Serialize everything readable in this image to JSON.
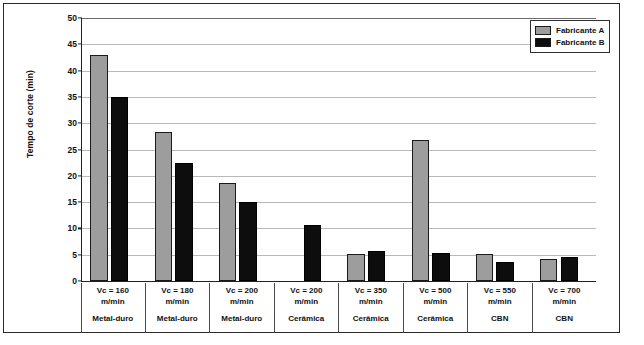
{
  "chart_data": {
    "type": "bar",
    "title": "",
    "xlabel": "",
    "ylabel": "Tempo de corte (min)",
    "ylim": [
      0,
      50
    ],
    "yticks": [
      0,
      5,
      10,
      15,
      20,
      25,
      30,
      35,
      40,
      45,
      50
    ],
    "grid": true,
    "legend_position": "top-right",
    "categories": [
      "Vc = 160 m/min",
      "Vc = 180 m/min",
      "Vc = 200 m/min",
      "Vc = 200 m/min",
      "Vc = 350 m/min",
      "Vc = 500 m/min",
      "Vc = 550 m/min",
      "Vc = 700 m/min"
    ],
    "category_lines": [
      {
        "vc": "Vc = 160\nm/min",
        "vc_line1": "Vc = 160",
        "vc_line2": "m/min",
        "material": "Metal-duro"
      },
      {
        "vc": "Vc = 180\nm/min",
        "vc_line1": "Vc = 180",
        "vc_line2": "m/min",
        "material": "Metal-duro"
      },
      {
        "vc": "Vc = 200\nm/min",
        "vc_line1": "Vc = 200",
        "vc_line2": "m/min",
        "material": "Metal-duro"
      },
      {
        "vc": "Vc = 200\nm/min",
        "vc_line1": "Vc = 200",
        "vc_line2": "m/min",
        "material": "Cerâmica"
      },
      {
        "vc": "Vc = 350\nm/min",
        "vc_line1": "Vc = 350",
        "vc_line2": "m/min",
        "material": "Cerâmica"
      },
      {
        "vc": "Vc = 500\nm/min",
        "vc_line1": "Vc = 500",
        "vc_line2": "m/min",
        "material": "Cerâmica"
      },
      {
        "vc": "Vc = 550\nm/min",
        "vc_line1": "Vc = 550",
        "vc_line2": "m/min",
        "material": "CBN"
      },
      {
        "vc": "Vc = 700\nm/min",
        "vc_line1": "Vc = 700",
        "vc_line2": "m/min",
        "material": "CBN"
      }
    ],
    "series": [
      {
        "name": "Fabricante A",
        "color": "#9d9d9d",
        "values": [
          43.0,
          28.3,
          18.6,
          null,
          5.1,
          26.8,
          5.1,
          4.1
        ]
      },
      {
        "name": "Fabricante B",
        "color": "#0d0d0d",
        "values": [
          35.0,
          22.4,
          15.0,
          10.6,
          5.7,
          5.3,
          3.7,
          4.6
        ]
      }
    ]
  },
  "legend": {
    "items": [
      {
        "label": "Fabricante A",
        "color": "#9d9d9d"
      },
      {
        "label": "Fabricante B",
        "color": "#0d0d0d"
      }
    ]
  },
  "axis": {
    "y_title": "Tempo de corte (min)"
  }
}
